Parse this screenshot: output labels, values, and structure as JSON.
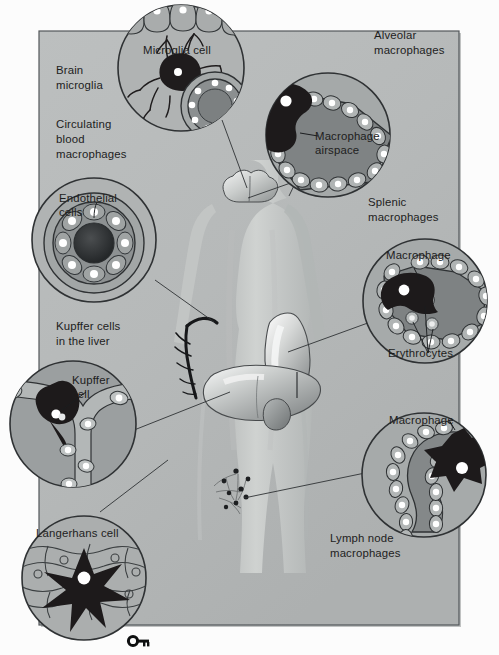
{
  "figure": {
    "frame": {
      "background_color": "#b9bcbc",
      "paper_color": "#fbfbfb",
      "border_color": "#4b4f52",
      "x": 39,
      "y": 31,
      "width": 420,
      "height": 594
    },
    "palette": {
      "circle_outer_fill": "#b0b3b3",
      "circle_outer_stroke": "#3a3d3f",
      "circle_inner_fill": "#8f9394",
      "dark_cell": "#231f20",
      "highlight_white": "#ffffff",
      "body_silhouette": "#c8cbca",
      "organ_light": "#e8eaea",
      "organ_mid": "#9fa3a4",
      "line_color": "#333638",
      "text_color": "#1d1d1d"
    }
  },
  "labels": {
    "brain_microglia": "Brain\nmicroglia",
    "brain_microglia_l1": "Brain",
    "brain_microglia_l2": "microglia",
    "circulating_l1": "Circulating",
    "circulating_l2": "blood",
    "circulating_l3": "macrophages",
    "endothelial_l1": "Endothelial",
    "endothelial_l2": "cells",
    "kupffer_liver_l1": "Kupffer cells",
    "kupffer_liver_l2": "in the liver",
    "kupffer_cell_l1": "Kupffer",
    "kupffer_cell_l2": "cell",
    "langerhans": "Langerhans cell",
    "microglia_cell": "Microglia cell",
    "alveolar_l1": "Alveolar",
    "alveolar_l2": "macrophages",
    "macrophage_airspace_l1": "Macrophage",
    "macrophage_airspace_l2": "airspace",
    "splenic_l1": "Splenic",
    "splenic_l2": "macrophages",
    "macrophage_spleen": "Macrophage",
    "erythrocytes": "Erythrocytes",
    "macrophage_lymph": "Macrophage",
    "lymph_node_l1": "Lymph node",
    "lymph_node_l2": "macrophages"
  },
  "callouts": [
    {
      "id": "microglia-cell-callout",
      "label": "Microglia cell",
      "organ": "brain",
      "position": "top-center"
    },
    {
      "id": "endothelial-cells-callout",
      "label": "Endothelial cells",
      "organ": "blood vessel",
      "position": "left-upper"
    },
    {
      "id": "kupffer-cell-callout",
      "label": "Kupffer cell",
      "organ": "liver",
      "position": "left-lower"
    },
    {
      "id": "langerhans-cell-callout",
      "label": "Langerhans cell",
      "organ": "skin",
      "position": "bottom-left"
    },
    {
      "id": "alveolar-macrophage-callout",
      "label": "Macrophage airspace",
      "organ": "lung",
      "position": "top-right"
    },
    {
      "id": "splenic-macrophage-callout",
      "label": "Macrophage / Erythrocytes",
      "organ": "spleen",
      "position": "right-upper"
    },
    {
      "id": "lymph-node-macrophage-callout",
      "label": "Macrophage",
      "organ": "lymph node",
      "position": "bottom-right"
    }
  ],
  "icons": {
    "key": "key-icon"
  }
}
